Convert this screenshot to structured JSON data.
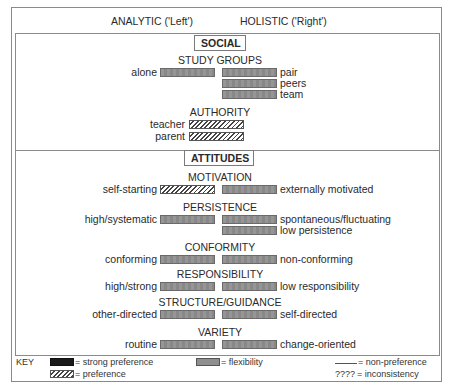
{
  "header": {
    "left_label": "ANALYTIC ('Left')",
    "right_label": "HOLISTIC ('Right')"
  },
  "sections": [
    {
      "title": "SOCIAL",
      "groups": [
        {
          "title": "STUDY GROUPS",
          "left": [
            {
              "label": "alone",
              "type": "flexibility"
            }
          ],
          "right": [
            {
              "label": "pair",
              "type": "flexibility"
            },
            {
              "label": "peers",
              "type": "flexibility"
            },
            {
              "label": "team",
              "type": "flexibility"
            }
          ]
        },
        {
          "title": "AUTHORITY",
          "left": [
            {
              "label": "teacher",
              "type": "preference"
            },
            {
              "label": "parent",
              "type": "preference"
            }
          ],
          "right": []
        }
      ]
    },
    {
      "title": "ATTITUDES",
      "groups": [
        {
          "title": "MOTIVATION",
          "left": [
            {
              "label": "self-starting",
              "type": "preference"
            }
          ],
          "right": [
            {
              "label": "externally motivated",
              "type": "flexibility"
            }
          ]
        },
        {
          "title": "PERSISTENCE",
          "left": [
            {
              "label": "high/systematic",
              "type": "flexibility"
            }
          ],
          "right": [
            {
              "label": "spontaneous/fluctuating",
              "type": "flexibility"
            },
            {
              "label": "low persistence",
              "type": "flexibility"
            }
          ]
        },
        {
          "title": "CONFORMITY",
          "left": [
            {
              "label": "conforming",
              "type": "flexibility"
            }
          ],
          "right": [
            {
              "label": "non-conforming",
              "type": "flexibility"
            }
          ]
        },
        {
          "title": "RESPONSIBILITY",
          "left": [
            {
              "label": "high/strong",
              "type": "flexibility"
            }
          ],
          "right": [
            {
              "label": "low responsibility",
              "type": "flexibility"
            }
          ]
        },
        {
          "title": "STRUCTURE/GUIDANCE",
          "left": [
            {
              "label": "other-directed",
              "type": "flexibility"
            }
          ],
          "right": [
            {
              "label": "self-directed",
              "type": "flexibility"
            }
          ]
        },
        {
          "title": "VARIETY",
          "left": [
            {
              "label": "routine",
              "type": "flexibility"
            }
          ],
          "right": [
            {
              "label": "change-oriented",
              "type": "flexibility"
            }
          ]
        }
      ]
    }
  ],
  "key": {
    "title": "KEY",
    "items": [
      {
        "symbol": "strong-preference-swatch",
        "label": "= strong preference"
      },
      {
        "symbol": "flexibility-swatch",
        "label": "= flexibility"
      },
      {
        "symbol": "non-preference-line",
        "label": "= non-preference"
      },
      {
        "symbol": "preference-swatch",
        "label": "= preference"
      },
      {
        "symbol": "inconsistency-marks",
        "marks": "????",
        "label": "= inconsistency"
      }
    ]
  },
  "colors": {
    "border": "#8a8a8a",
    "flexibility": "#8f8f8f",
    "strong_preference": "#1a1a1a",
    "text": "#2a2a2a"
  }
}
